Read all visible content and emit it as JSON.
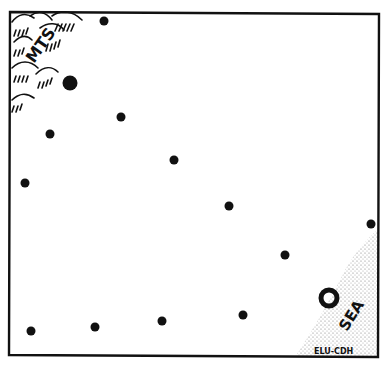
{
  "diagram": {
    "type": "map-sketch",
    "labels": {
      "mountains": "MTS",
      "sea": "SEA",
      "credit": "ELU-CDH"
    },
    "colors": {
      "ink": "#111111",
      "background": "#ffffff",
      "stipple": "#777777"
    },
    "frame": {
      "x": 9,
      "y": 11,
      "width": 370,
      "height": 346
    },
    "features": {
      "mountains_region": "top-left corner",
      "sea_region": "bottom-right corner (stippled)"
    },
    "points": [
      {
        "x": 104,
        "y": 21,
        "r": 4.5,
        "kind": "dot"
      },
      {
        "x": 70,
        "y": 83,
        "r": 7.5,
        "kind": "large-dot"
      },
      {
        "x": 121,
        "y": 117,
        "r": 4.5,
        "kind": "dot"
      },
      {
        "x": 50,
        "y": 134,
        "r": 4.5,
        "kind": "dot"
      },
      {
        "x": 174,
        "y": 160,
        "r": 4.5,
        "kind": "dot"
      },
      {
        "x": 25,
        "y": 183,
        "r": 4.5,
        "kind": "dot"
      },
      {
        "x": 229,
        "y": 206,
        "r": 4.5,
        "kind": "dot"
      },
      {
        "x": 371,
        "y": 224,
        "r": 4.5,
        "kind": "dot"
      },
      {
        "x": 285,
        "y": 255,
        "r": 4.5,
        "kind": "dot"
      },
      {
        "x": 329,
        "y": 298,
        "r": 9,
        "kind": "ring"
      },
      {
        "x": 31,
        "y": 331,
        "r": 4.5,
        "kind": "dot"
      },
      {
        "x": 95,
        "y": 327,
        "r": 4.5,
        "kind": "dot"
      },
      {
        "x": 162,
        "y": 321,
        "r": 4.5,
        "kind": "dot"
      },
      {
        "x": 243,
        "y": 315,
        "r": 4.5,
        "kind": "dot"
      }
    ]
  }
}
